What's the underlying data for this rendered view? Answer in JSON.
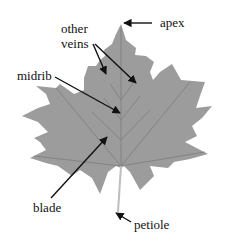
{
  "diagram": {
    "colors": {
      "leaf": "#9a9a9a",
      "vein": "#808080",
      "arrow": "#111111",
      "background": "#ffffff"
    },
    "labels": {
      "apex": "apex",
      "other_veins_line1": "other",
      "other_veins_line2": "veins",
      "midrib": "midrib",
      "blade": "blade",
      "petiole": "petiole"
    }
  }
}
